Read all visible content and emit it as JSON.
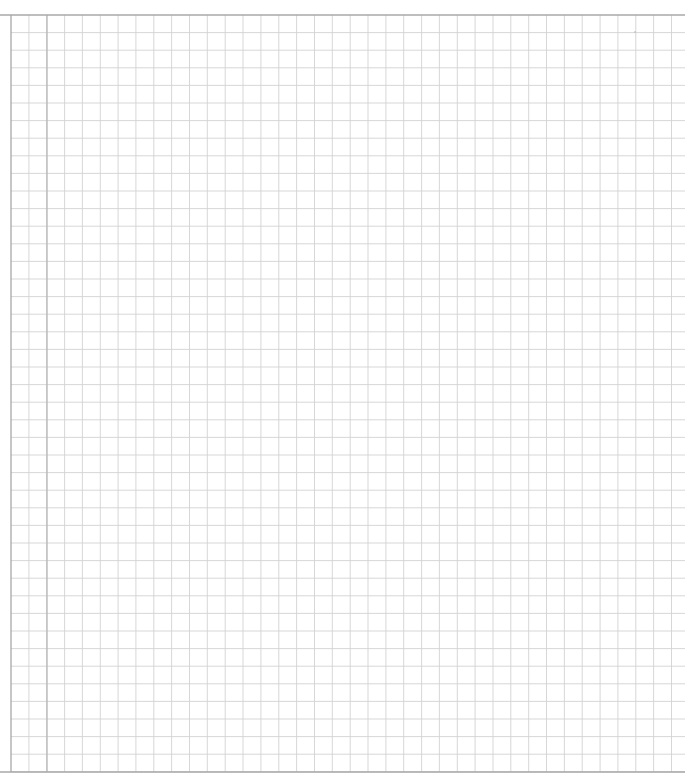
{
  "page": {
    "type": "graph-paper",
    "content_text": "",
    "colors": {
      "background": "#ffffff",
      "grid_line": "#d2d2d2",
      "border_line": "#a8a8a8",
      "margin_line": "#b4b4b4"
    },
    "grid": {
      "left": 11,
      "top": 15,
      "right": 685,
      "bottom": 772,
      "cell_width": 17.85,
      "cell_height": 17.6,
      "margin_line_x": 47
    },
    "marks": [
      {
        "x": 635,
        "y": 32,
        "r": 0.8
      }
    ]
  }
}
